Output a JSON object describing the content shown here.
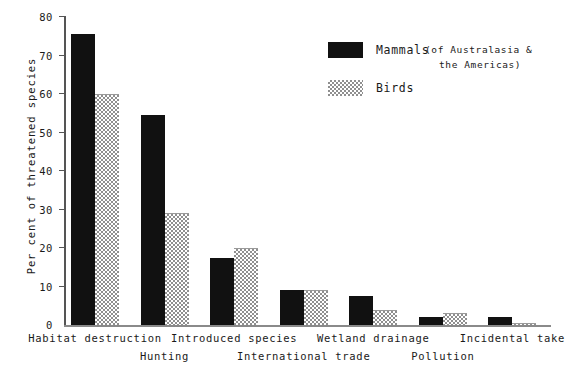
{
  "chart_data": {
    "type": "bar",
    "title": "",
    "subtitle": "",
    "xlabel": "",
    "ylabel": "Per cent of threatened species",
    "ylim": [
      0,
      80
    ],
    "ytick_step": 10,
    "yticks": [
      "80",
      "70",
      "60",
      "50",
      "40",
      "30",
      "20",
      "10",
      "0"
    ],
    "grid": false,
    "legend_position": "upper-center-right",
    "categories": [
      "Habitat destruction",
      "Hunting",
      "Introduced species",
      "International trade",
      "Wetland drainage",
      "Pollution",
      "Incidental take"
    ],
    "series": [
      {
        "name": "Mammals",
        "color": "#111111",
        "fill": "solid-black",
        "values": [
          75.5,
          54.5,
          17.5,
          9,
          7.5,
          2,
          2
        ]
      },
      {
        "name": "Birds",
        "color": "#8f8f8f",
        "fill": "checkered-grey",
        "values": [
          60,
          29,
          20,
          9,
          4,
          3,
          0.5
        ]
      }
    ],
    "annotations": [
      "(of Australasia &",
      "the Americas)"
    ]
  },
  "legend": {
    "items": [
      {
        "label": "Mammals",
        "swatch": "solid-black-swatch"
      },
      {
        "label": "Birds",
        "swatch": "checkered-grey-swatch"
      }
    ],
    "note_line_1": "(of Australasia &",
    "note_line_2": "the Americas)"
  },
  "axes": {
    "y_title": "Per cent of threatened species",
    "y_labels": [
      "80",
      "70",
      "60",
      "50",
      "40",
      "30",
      "20",
      "10",
      "0"
    ],
    "x_labels": [
      "Habitat destruction",
      "Hunting",
      "Introduced species",
      "International trade",
      "Wetland drainage",
      "Pollution",
      "Incidental take"
    ]
  }
}
